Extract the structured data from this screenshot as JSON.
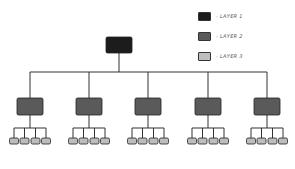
{
  "legend": {
    "items": [
      {
        "label": "- LAYER 1",
        "color": "#1c1c1c"
      },
      {
        "label": "- LAYER 2",
        "color": "#5a5a5a"
      },
      {
        "label": "- LAYER 3",
        "color": "#bdbdbd"
      }
    ]
  },
  "colors": {
    "line": "#333333",
    "layer1": "#1c1c1c",
    "layer2": "#5a5a5a",
    "layer3": "#bdbdbd"
  },
  "tree": {
    "root": {
      "layer": 1
    },
    "branches": [
      {
        "layer": 2,
        "children": 4
      },
      {
        "layer": 2,
        "children": 4
      },
      {
        "layer": 2,
        "children": 4
      },
      {
        "layer": 2,
        "children": 4
      },
      {
        "layer": 2,
        "children": 4
      }
    ]
  }
}
